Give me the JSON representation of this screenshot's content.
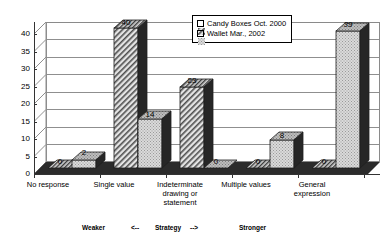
{
  "chart_data": {
    "type": "bar",
    "title": "",
    "xlabel": "",
    "ylabel": "",
    "ylim": [
      0,
      40
    ],
    "yticks": [
      "0",
      "5",
      "10",
      "15",
      "20",
      "25",
      "30",
      "35",
      "40"
    ],
    "grid": true,
    "legend_position": "top-center",
    "categories": [
      "No response",
      "Single value",
      "Indeterminate drawing or statement",
      "Multiple values",
      "General expression"
    ],
    "category_lines": [
      [
        "No response"
      ],
      [
        "Single value"
      ],
      [
        "Indeterminate",
        "drawing or",
        "statement"
      ],
      [
        "Multiple values"
      ],
      [
        "General",
        "expression"
      ]
    ],
    "series": [
      {
        "name": "Candy Boxes Oct. 2000",
        "values": [
          0,
          40,
          23,
          0,
          0
        ],
        "labels": [
          "0",
          "40",
          "23",
          "0",
          "0"
        ],
        "fill": "diagonal-hatch",
        "color": "#d9d9d9"
      },
      {
        "name": "Wallet Mar., 2002",
        "values": [
          2,
          14,
          0,
          8,
          39
        ],
        "labels": [
          "2",
          "14",
          "0",
          "8",
          "39"
        ],
        "fill": "dotted",
        "color": "#d0d0d0"
      }
    ],
    "annotations": {
      "weaker": "Weaker",
      "arrow_left": "<--",
      "strategy": "Strategy",
      "arrow_right": "-->",
      "stronger": "Stronger"
    }
  },
  "legend": {
    "items": [
      {
        "label": "Candy Boxes Oct. 2000",
        "swatch": "hatch-swatch"
      },
      {
        "label": "Wallet Mar., 2002",
        "swatch": "dotted-swatch"
      }
    ]
  },
  "colors": {
    "wall": "#ffffff",
    "gridline": "#8f8f8f",
    "floor": "#2b2b2b",
    "bar_side": "#262626",
    "bar_top": "#4a4a4a",
    "axis": "#333333"
  }
}
